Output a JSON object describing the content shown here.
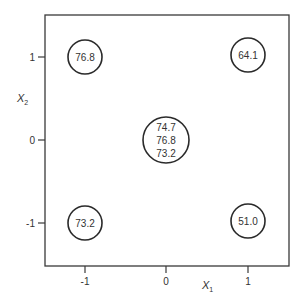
{
  "diagram": {
    "type": "factorial-design-square",
    "x_axis": {
      "label": "X",
      "subscript": "1",
      "ticks": [
        {
          "value": "-1",
          "x": 85
        },
        {
          "value": "0",
          "x": 166
        },
        {
          "value": "1",
          "x": 248
        }
      ]
    },
    "y_axis": {
      "label": "X",
      "subscript": "2",
      "ticks": [
        {
          "value": "1",
          "y": 57
        },
        {
          "value": "0",
          "y": 140
        },
        {
          "value": "-1",
          "y": 223
        }
      ]
    },
    "points": [
      {
        "x1": "-1",
        "x2": "1",
        "values": [
          "76.8"
        ]
      },
      {
        "x1": "1",
        "x2": "1",
        "values": [
          "64.1"
        ]
      },
      {
        "x1": "0",
        "x2": "0",
        "values": [
          "74.7",
          "76.8",
          "73.2"
        ]
      },
      {
        "x1": "-1",
        "x2": "-1",
        "values": [
          "73.2"
        ]
      },
      {
        "x1": "1",
        "x2": "-1",
        "values": [
          "51.0"
        ]
      }
    ],
    "colors": {
      "line": "#3a3a3a",
      "text": "#333333",
      "background": "#ffffff"
    }
  }
}
